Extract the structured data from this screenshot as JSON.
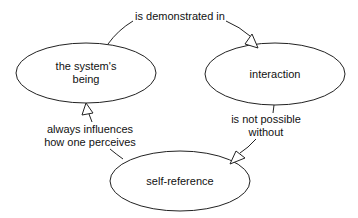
{
  "diagram": {
    "type": "concept-map",
    "colors": {
      "background": "#ffffff",
      "stroke": "#222222",
      "text": "#111111",
      "arrow_fill": "#ffffff"
    },
    "nodes": [
      {
        "id": "being",
        "label_line1": "the system's",
        "label_line2": "being"
      },
      {
        "id": "interaction",
        "label_line1": "interaction"
      },
      {
        "id": "selfref",
        "label_line1": "self-reference"
      }
    ],
    "edges": [
      {
        "from": "being",
        "to": "interaction",
        "label_line1": "is demonstrated in"
      },
      {
        "from": "interaction",
        "to": "selfref",
        "label_line1": "is not possible",
        "label_line2": "without"
      },
      {
        "from": "selfref",
        "to": "being",
        "label_line1": "always influences",
        "label_line2": "how one perceives"
      }
    ]
  }
}
